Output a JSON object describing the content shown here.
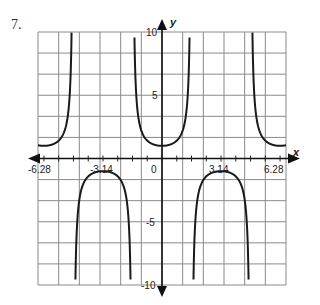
{
  "problem": {
    "number": "7."
  },
  "chart_data": {
    "type": "line",
    "title": "",
    "function": "y = sec(x)",
    "xlabel": "x",
    "ylabel": "y",
    "xlim": [
      -6.6,
      6.6
    ],
    "ylim": [
      -10,
      10
    ],
    "grid": true,
    "x_tick_labels": [
      "-6.28",
      "-3.14",
      "0",
      "3.14",
      "6.28"
    ],
    "x_tick_values": [
      -6.28,
      -3.14,
      0,
      3.14,
      6.28
    ],
    "y_tick_labels": [
      "10",
      "5",
      "-5",
      "-10"
    ],
    "y_tick_values": [
      10,
      5,
      -5,
      -10
    ],
    "asymptotes_x": [
      -4.71,
      -1.57,
      1.57,
      4.71
    ],
    "series": [
      {
        "name": "upper branch (left)",
        "x": [
          -6.6,
          -6.28,
          -5.5,
          -5.0,
          -4.9,
          -4.8
        ],
        "y": [
          1.05,
          1.0,
          1.41,
          3.53,
          5.4,
          11.0
        ]
      },
      {
        "name": "upper branch (center)",
        "x": [
          -1.52,
          -1.4,
          -1.0,
          0,
          1.0,
          1.4,
          1.52
        ],
        "y": [
          20.0,
          5.88,
          1.85,
          1.0,
          1.85,
          5.88,
          20.0
        ]
      },
      {
        "name": "upper branch (right)",
        "x": [
          4.8,
          4.9,
          5.0,
          5.5,
          6.28,
          6.6
        ],
        "y": [
          11.0,
          5.4,
          3.53,
          1.41,
          1.0,
          1.05
        ]
      },
      {
        "name": "lower branch (left)",
        "x": [
          -4.66,
          -4.5,
          -4.0,
          -3.14,
          -2.3,
          -1.8,
          -1.62
        ],
        "y": [
          -20.0,
          -4.8,
          -1.53,
          -1.0,
          -1.5,
          -4.4,
          -20.0
        ]
      },
      {
        "name": "lower branch (right)",
        "x": [
          1.62,
          1.8,
          2.3,
          3.14,
          4.0,
          4.5,
          4.66
        ],
        "y": [
          -20.0,
          -4.4,
          -1.5,
          -1.0,
          -1.53,
          -4.8,
          -20.0
        ]
      }
    ],
    "extrema": [
      {
        "x": 0,
        "y": 1,
        "type": "local min"
      },
      {
        "x": -6.28,
        "y": 1,
        "type": "local min"
      },
      {
        "x": 6.28,
        "y": 1,
        "type": "local min"
      },
      {
        "x": -3.14,
        "y": -1,
        "type": "local max"
      },
      {
        "x": 3.14,
        "y": -1,
        "type": "local max"
      }
    ]
  }
}
